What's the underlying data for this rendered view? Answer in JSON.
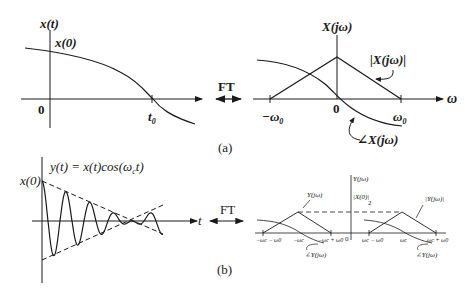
{
  "panel_a": {
    "time_plot": {
      "ylabel": "x(t)",
      "value_label": "x(0)",
      "origin_label": "0",
      "tick_label": "t",
      "tick_sub": "0"
    },
    "ft_label": "FT",
    "freq_plot": {
      "ylabel": "X(jω)",
      "xlabel": "ω",
      "origin_label": "0",
      "tick_left": "−ω",
      "tick_right": "ω",
      "tick_sub": "0",
      "magnitude_label": "|X(jω)|",
      "phase_label": "∠X(jω)"
    },
    "caption": "(a)"
  },
  "panel_b": {
    "time_plot": {
      "equation": "y(t) = x(t)cos(ω",
      "equation_sub": "c",
      "equation_tail": "t)",
      "value_label": "x(0)",
      "xlabel": "t"
    },
    "ft_label": "FT",
    "freq_plot": {
      "ylabel": "Y(jω)",
      "peak_label": "|X(0)|",
      "peak_div": "2",
      "origin_label": "0",
      "tick_labels": [
        "−ωc − ω0",
        "−ωc",
        "−ωc + ω0",
        "ωc − ω0",
        "ωc",
        "ωc + ω0"
      ],
      "magnitude_label_left": "Y(jω)",
      "magnitude_label_right": "|Y(jω)|",
      "phase_label_left": "∠Y(jω)",
      "phase_label_right": "∠Y(jω)"
    },
    "caption": "(b)"
  }
}
